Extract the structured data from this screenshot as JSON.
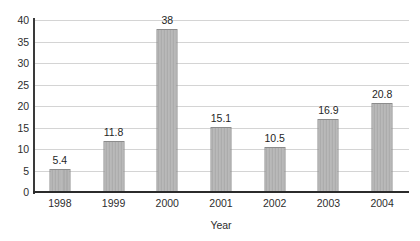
{
  "chart_data": {
    "type": "bar",
    "title": "",
    "subtitle": "",
    "xlabel": "Year",
    "ylabel": "",
    "categories": [
      "1998",
      "1999",
      "2000",
      "2001",
      "2002",
      "2003",
      "2004"
    ],
    "values": [
      5.4,
      11.8,
      38,
      15.1,
      10.5,
      16.9,
      20.8
    ],
    "value_labels": [
      "5.4",
      "11.8",
      "38",
      "15.1",
      "10.5",
      "16.9",
      "20.8"
    ],
    "ylim": [
      0,
      40
    ],
    "ytick_step": 5,
    "ytick_labels": [
      "40",
      "35",
      "30",
      "25",
      "20",
      "15",
      "10",
      "5",
      "0"
    ],
    "ytick_values": [
      40,
      35,
      30,
      25,
      20,
      15,
      10,
      5,
      0
    ],
    "grid": "horizontal",
    "legend": "none",
    "colors": {
      "bar_fill": "#b6b6b6",
      "bar_border": "#8c8c8c",
      "gridline": "#d4d4d4",
      "axis": "#2b2b2b",
      "text": "#2d2d2d",
      "background": "#ffffff"
    }
  }
}
